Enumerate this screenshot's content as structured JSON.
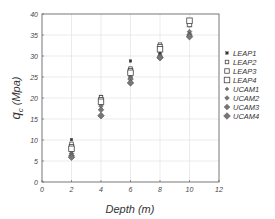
{
  "chart_data": {
    "type": "scatter",
    "title": "",
    "xlabel": "Depth (m)",
    "ylabel": "q_c (Mpa)",
    "ylabel_main": "q",
    "ylabel_sub": "c",
    "ylabel_unit": "(Mpa)",
    "xlim": [
      0,
      12
    ],
    "ylim": [
      0,
      40
    ],
    "xticks": [
      0,
      2,
      4,
      6,
      8,
      10,
      12
    ],
    "yticks": [
      0,
      5,
      10,
      15,
      20,
      25,
      30,
      35,
      40
    ],
    "grid": true,
    "legend_position": "right",
    "x": [
      2,
      4,
      6,
      8,
      10
    ],
    "series": [
      {
        "name": "LEAP1",
        "marker": "square-filled",
        "size": 2.5,
        "values": [
          10.1,
          20.4,
          28.8,
          30.8,
          37.2
        ]
      },
      {
        "name": "LEAP2",
        "marker": "square-open",
        "size": 3.5,
        "values": [
          9.1,
          20.2,
          27.0,
          32.7,
          38.0
        ]
      },
      {
        "name": "LEAP3",
        "marker": "square-open",
        "size": 4.5,
        "values": [
          8.4,
          19.6,
          26.5,
          32.2,
          37.5
        ]
      },
      {
        "name": "LEAP4",
        "marker": "square-open",
        "size": 5.5,
        "values": [
          7.9,
          19.1,
          26.0,
          31.6,
          38.4
        ]
      },
      {
        "name": "UCAM1",
        "marker": "diamond-filled",
        "size": 2.5,
        "values": [
          7.3,
          18.8,
          25.7,
          30.4,
          35.4
        ]
      },
      {
        "name": "UCAM2",
        "marker": "diamond-filled",
        "size": 3.5,
        "values": [
          6.8,
          18.1,
          25.0,
          30.0,
          35.8
        ]
      },
      {
        "name": "UCAM3",
        "marker": "diamond-filled",
        "size": 4.5,
        "values": [
          6.3,
          17.2,
          24.5,
          29.7,
          35.0
        ]
      },
      {
        "name": "UCAM4",
        "marker": "diamond-filled",
        "size": 5.5,
        "values": [
          5.9,
          15.8,
          23.6,
          29.6,
          34.6
        ]
      }
    ]
  },
  "colors": {
    "axis": "#555555",
    "grid": "#e2e2e2",
    "square_stroke": "#444444",
    "square_fill_filled": "#333333",
    "diamond_fill": "#777777",
    "diamond_stroke": "#444444"
  }
}
